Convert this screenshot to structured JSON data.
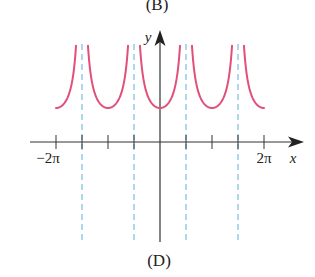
{
  "top_caption": "(B)",
  "bottom_caption": "(D)",
  "colors": {
    "curve": "#e0507a",
    "asymptote": "#6ab8e0",
    "axis": "#333333"
  },
  "chart_data": {
    "type": "line",
    "title": "",
    "caption": "(D)",
    "function_hint": "y = a|sec x| (positive branches, vertical asymptotes at odd multiples of pi/2)",
    "xlabel": "x",
    "ylabel": "y",
    "xlim_units_of_pi": [
      -2.0,
      2.0
    ],
    "x_tick_positions_units_of_pi": [
      -2,
      -1.5,
      -1,
      -0.5,
      0,
      0.5,
      1,
      1.5,
      2
    ],
    "x_tick_labels": [
      {
        "at_units_of_pi": -2,
        "label": "−2π"
      },
      {
        "at_units_of_pi": 2,
        "label": "2π"
      }
    ],
    "asymptotes_units_of_pi": [
      -1.5,
      -0.5,
      0.5,
      1.5
    ],
    "branch_minima_units_of_pi": [
      -2,
      -1,
      0,
      1,
      2
    ],
    "branch_min_value": 1,
    "grid": false,
    "legend": null
  }
}
